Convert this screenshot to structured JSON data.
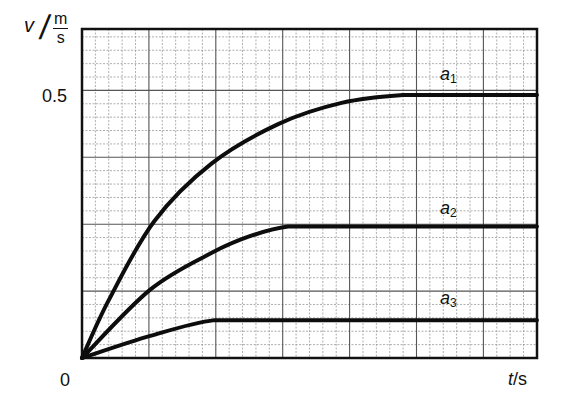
{
  "chart_data": {
    "type": "line",
    "title": "",
    "xlabel": "t/s",
    "ylabel": "v / (m/s)",
    "ylabel_parts": {
      "symbol": "v",
      "unit_numerator": "m",
      "unit_denominator": "s"
    },
    "xlabel_parts": {
      "symbol": "t",
      "unit": "/s"
    },
    "y_tick_labels": [
      "0",
      "0.5"
    ],
    "x_tick_labels": [
      "0"
    ],
    "origin_label": "0",
    "ylim": [
      0,
      0.625
    ],
    "xlim": [
      0,
      34
    ],
    "x_units_note": "grid cells (no numeric time ticks shown)",
    "grid": {
      "on": true,
      "minor_per_major": 5,
      "y_minor_step": 0.025,
      "y_major_step": 0.125
    },
    "legend": "inline labels near curves",
    "series": [
      {
        "name": "a1",
        "label_main": "a",
        "label_sub": "1",
        "plateau_v": 0.5,
        "plateau_start_t": 24,
        "points": [
          [
            0,
            0
          ],
          [
            2,
            0.11
          ],
          [
            5.4,
            0.26
          ],
          [
            9.7,
            0.37
          ],
          [
            14.7,
            0.445
          ],
          [
            19.4,
            0.485
          ],
          [
            24,
            0.5
          ],
          [
            34,
            0.5
          ]
        ]
      },
      {
        "name": "a2",
        "label_main": "a",
        "label_sub": "2",
        "plateau_v": 0.25,
        "plateau_start_t": 15.4,
        "points": [
          [
            0,
            0
          ],
          [
            5.1,
            0.13
          ],
          [
            9.7,
            0.2
          ],
          [
            12.6,
            0.232
          ],
          [
            15.4,
            0.25
          ],
          [
            34,
            0.25
          ]
        ]
      },
      {
        "name": "a3",
        "label_main": "a",
        "label_sub": "3",
        "plateau_v": 0.072,
        "plateau_start_t": 9.9,
        "points": [
          [
            0,
            0
          ],
          [
            5.1,
            0.042
          ],
          [
            9.9,
            0.072
          ],
          [
            34,
            0.072
          ]
        ]
      }
    ]
  },
  "layout": {
    "plot_px": {
      "left": 82,
      "top": 29,
      "right": 537,
      "bottom": 358
    },
    "x_px_per_unit": 13.38,
    "y_px_per_unit": 526,
    "series_label_px": [
      [
        440,
        64
      ],
      [
        440,
        198
      ],
      [
        440,
        288
      ]
    ]
  }
}
